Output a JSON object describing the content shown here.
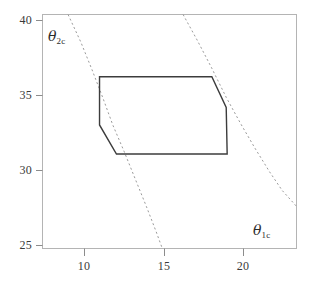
{
  "chart_data": {
    "type": "line",
    "title": "",
    "xlabel": "θ_1c",
    "ylabel": "θ_2c",
    "xlabel_symbol": "θ",
    "xlabel_subscript": "1c",
    "ylabel_symbol": "θ",
    "ylabel_subscript": "2c",
    "xlim": [
      7.5,
      23.4
    ],
    "ylim": [
      24.3,
      40.4
    ],
    "xticks": [
      10,
      15,
      20
    ],
    "xtick_labels": [
      "10",
      "15",
      "20"
    ],
    "yticks": [
      25,
      30,
      35,
      40
    ],
    "ytick_labels": [
      "25",
      "30",
      "35",
      "40"
    ],
    "grid": false,
    "legend": "none",
    "series": [
      {
        "name": "confidence-region-polygon",
        "type": "polygon",
        "style": "solid",
        "color": "#3c3c3c",
        "closed": true,
        "points": [
          [
            11.07,
            36.12
          ],
          [
            18.1,
            36.12
          ],
          [
            19.0,
            34.0
          ],
          [
            19.06,
            30.8
          ],
          [
            12.13,
            30.8
          ],
          [
            11.07,
            32.8
          ]
        ]
      },
      {
        "name": "left-dashed-curve",
        "type": "curve",
        "style": "dashed",
        "color": "#9a9a9a",
        "closed": false,
        "points": [
          [
            9.1,
            40.4
          ],
          [
            9.9,
            38.5
          ],
          [
            10.6,
            36.6
          ],
          [
            11.3,
            34.6
          ],
          [
            11.9,
            32.8
          ],
          [
            12.6,
            31.0
          ],
          [
            13.3,
            29.1
          ],
          [
            14.0,
            27.2
          ],
          [
            14.6,
            25.5
          ],
          [
            15.0,
            24.3
          ]
        ]
      },
      {
        "name": "right-dashed-curve",
        "type": "curve",
        "style": "dashed",
        "color": "#9a9a9a",
        "closed": false,
        "points": [
          [
            16.3,
            40.4
          ],
          [
            17.2,
            38.6
          ],
          [
            18.1,
            36.7
          ],
          [
            19.0,
            34.7
          ],
          [
            19.9,
            32.9
          ],
          [
            20.8,
            31.2
          ],
          [
            21.7,
            29.6
          ],
          [
            22.5,
            28.3
          ],
          [
            23.4,
            27.2
          ]
        ]
      }
    ]
  },
  "axes": {
    "frame_color": "#b4b4b4",
    "tick_color": "#8c8c8c",
    "label_color": "#3a3a3a"
  }
}
